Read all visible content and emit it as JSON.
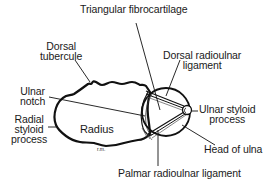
{
  "diagram": {
    "labels": {
      "triangular_fibrocartilage": "Triangular fibrocartilage",
      "dorsal_tubercule_line1": "Dorsal",
      "dorsal_tubercule_line2": "tubercule",
      "dorsal_radioulnar_line1": "Dorsal radioulnar",
      "dorsal_radioulnar_line2": "ligament",
      "ulnar_notch_line1": "Ulnar",
      "ulnar_notch_line2": "notch",
      "radial_styloid_line1": "Radial",
      "radial_styloid_line2": "styloid",
      "radial_styloid_line3": "process",
      "radius": "Radius",
      "ulnar_styloid_line1": "Ulnar styloid",
      "ulnar_styloid_line2": "process",
      "head_of_ulna": "Head of ulna",
      "palmar_radioulnar_ligament": "Palmar radioulnar ligament",
      "artist_initials": "r.m."
    },
    "colors": {
      "outline": "#111111",
      "text": "#1a1a1a",
      "background": "#ffffff"
    }
  }
}
